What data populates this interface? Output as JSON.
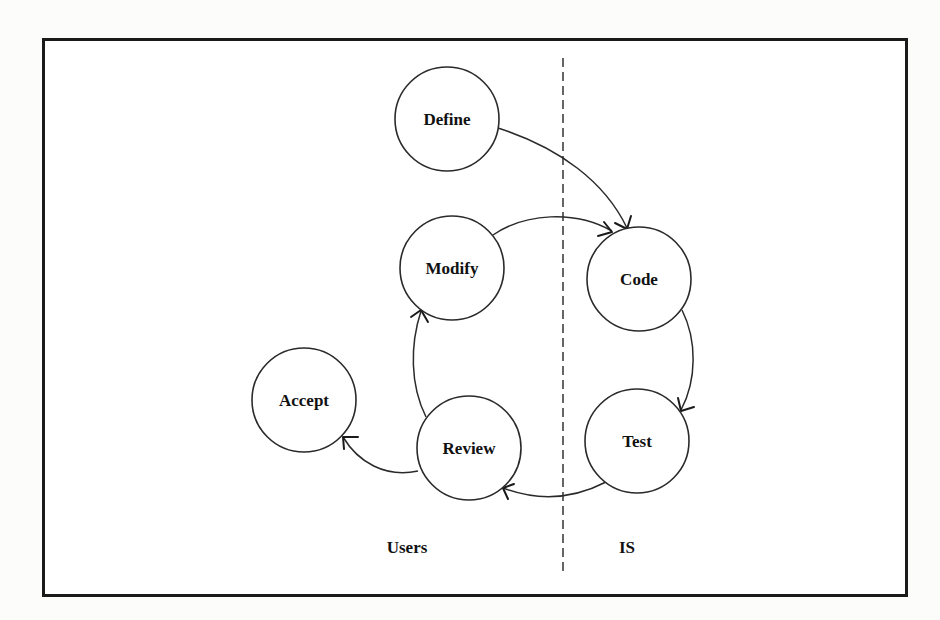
{
  "diagram": {
    "type": "process-cycle",
    "lanes": [
      {
        "id": "users",
        "label": "Users"
      },
      {
        "id": "is",
        "label": "IS"
      }
    ],
    "nodes": [
      {
        "id": "define",
        "label": "Define",
        "lane": "users"
      },
      {
        "id": "modify",
        "label": "Modify",
        "lane": "users"
      },
      {
        "id": "code",
        "label": "Code",
        "lane": "is"
      },
      {
        "id": "test",
        "label": "Test",
        "lane": "is"
      },
      {
        "id": "review",
        "label": "Review",
        "lane": "users"
      },
      {
        "id": "accept",
        "label": "Accept",
        "lane": "users"
      }
    ],
    "edges": [
      {
        "from": "define",
        "to": "code"
      },
      {
        "from": "modify",
        "to": "code"
      },
      {
        "from": "code",
        "to": "test"
      },
      {
        "from": "test",
        "to": "review"
      },
      {
        "from": "review",
        "to": "modify"
      },
      {
        "from": "review",
        "to": "accept"
      }
    ],
    "colors": {
      "line": "#2a2a2a",
      "frame": "#1a1a1a",
      "background": "#ffffff"
    }
  }
}
